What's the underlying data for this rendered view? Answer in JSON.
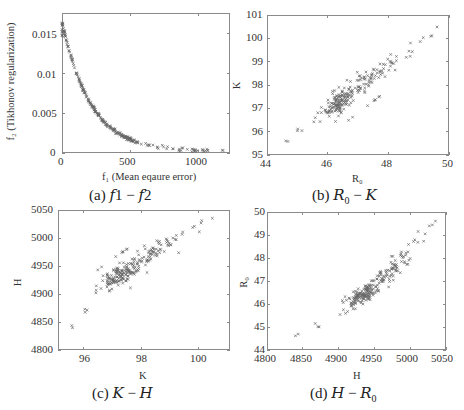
{
  "figure": {
    "panels": [
      {
        "id": "a",
        "caption": "(a) f1 − f2",
        "frame": {
          "left": 62,
          "top": 13,
          "right": 230,
          "bottom": 153
        },
        "xaxis": {
          "label": "f₁  (Mean eqaure error)",
          "min": 0,
          "max": 1230,
          "ticks": [
            0,
            500,
            1000
          ]
        },
        "yaxis": {
          "label": "f₂  (Tikhonov regularization)",
          "min": 0,
          "max": 0.0175,
          "ticks": [
            0,
            0.005,
            0.01,
            0.015
          ],
          "tick_labels": [
            "0",
            "0.005",
            "0.01",
            "0.015"
          ]
        }
      },
      {
        "id": "b",
        "caption": "(b) R₀ − K",
        "frame": {
          "left": 267,
          "top": 15,
          "right": 449,
          "bottom": 155
        },
        "xaxis": {
          "label": "R₀",
          "min": 44,
          "max": 50,
          "ticks": [
            44,
            46,
            48,
            50
          ]
        },
        "yaxis": {
          "label": "K",
          "min": 95,
          "max": 101,
          "ticks": [
            95,
            96,
            97,
            98,
            99,
            100,
            101
          ]
        }
      },
      {
        "id": "c",
        "caption": "(c) K − H",
        "frame": {
          "left": 58,
          "top": 210,
          "right": 230,
          "bottom": 350
        },
        "xaxis": {
          "label": "K",
          "min": 95.1,
          "max": 101.1,
          "ticks": [
            96,
            98,
            100
          ]
        },
        "yaxis": {
          "label": "H",
          "min": 4800,
          "max": 5050,
          "ticks": [
            4800,
            4850,
            4900,
            4950,
            5000,
            5050
          ]
        }
      },
      {
        "id": "d",
        "caption": "(d) H − R₀",
        "frame": {
          "left": 267,
          "top": 212,
          "right": 446,
          "bottom": 350
        },
        "xaxis": {
          "label": "H",
          "min": 4800,
          "max": 5050,
          "ticks": [
            4800,
            4850,
            4900,
            4950,
            5000,
            5050
          ]
        },
        "yaxis": {
          "label": "R₀",
          "min": 44,
          "max": 50,
          "ticks": [
            44,
            45,
            46,
            47,
            48,
            49,
            50
          ]
        }
      }
    ]
  },
  "chart_data": [
    {
      "type": "scatter",
      "panel": "a",
      "title": "(a) f1 − f2",
      "xlabel": "f1 (Mean eqaure error)",
      "ylabel": "f2 (Tikhonov regularization)",
      "xlim": [
        0,
        1230
      ],
      "ylim": [
        0,
        0.0175
      ],
      "xticks": [
        0,
        500,
        1000
      ],
      "yticks": [
        0,
        0.005,
        0.01,
        0.015
      ],
      "grid": false,
      "marker": "x",
      "note": "Illustrative points approximating the visible Pareto front, not values read from the figure. The front is dense near f1=0 to 550 and sparser out to about 1200.",
      "description": "Convex Pareto front: f2 falls from about 0.016 at f1≈0 to about 0.0002 at f1≈1200"
    },
    {
      "type": "scatter",
      "panel": "b",
      "title": "(b) R0 − K",
      "xlabel": "R0",
      "ylabel": "K",
      "xlim": [
        44,
        50
      ],
      "ylim": [
        95,
        101
      ],
      "xticks": [
        44,
        46,
        48,
        50
      ],
      "yticks": [
        95,
        96,
        97,
        98,
        99,
        100,
        101
      ],
      "grid": false,
      "marker": "x",
      "note": "Illustrative points approximating the visible trend, not values read from the figure.",
      "description": "Strong positive correlation from (44.6, 95.6) to (49.8, 100.5); dense cluster near R0≈46.4, K≈97.3"
    },
    {
      "type": "scatter",
      "panel": "c",
      "title": "(c) K − H",
      "xlabel": "K",
      "ylabel": "H",
      "xlim": [
        95.1,
        101.1
      ],
      "ylim": [
        4800,
        5050
      ],
      "xticks": [
        96,
        98,
        100
      ],
      "yticks": [
        4800,
        4850,
        4900,
        4950,
        5000,
        5050
      ],
      "grid": false,
      "marker": "x",
      "note": "Illustrative points approximating the visible trend, not values read from the figure.",
      "description": "Positive, slightly concave trend from (95.6, 4825) to (100.6, 5030); dense cluster near K≈97.4, H≈4935"
    },
    {
      "type": "scatter",
      "panel": "d",
      "title": "(d) H − R0",
      "xlabel": "H",
      "ylabel": "R0",
      "xlim": [
        4800,
        5050
      ],
      "ylim": [
        44,
        50
      ],
      "xticks": [
        4800,
        4850,
        4900,
        4950,
        5000,
        5050
      ],
      "yticks": [
        44,
        45,
        46,
        47,
        48,
        49,
        50
      ],
      "grid": false,
      "marker": "x",
      "note": "Illustrative points approximating the visible trend, not values read from the figure.",
      "description": "Positive, convex trend from (4828, 44.8) to (5030, 49.6); dense cluster near H≈4935–4950, R0≈46.3–46.5"
    }
  ]
}
